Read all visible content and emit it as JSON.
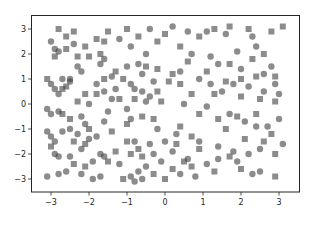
{
  "chart_data": {
    "type": "scatter",
    "title": "",
    "xlabel": "",
    "ylabel": "",
    "xlim": [
      -3.52,
      3.55
    ],
    "ylim": [
      -3.52,
      3.55
    ],
    "xticks": [
      -3,
      -2,
      -1,
      0,
      1,
      2,
      3
    ],
    "yticks": [
      -3,
      -2,
      -1,
      0,
      1,
      2,
      3
    ],
    "xtick_labels": [
      "−3",
      "−2",
      "−1",
      "0",
      "1",
      "2",
      "3"
    ],
    "ytick_labels": [
      "−3",
      "−2",
      "−1",
      "0",
      "1",
      "2",
      "3"
    ],
    "grid": false,
    "legend": null,
    "marker_color": "#404040",
    "marker_alpha": 0.6,
    "series": [
      {
        "name": "circles",
        "marker": "o",
        "points": [
          [
            -3.0,
            2.5
          ],
          [
            -2.9,
            2.2
          ],
          [
            -2.8,
            2.1
          ],
          [
            -2.3,
            1.5
          ],
          [
            -2.2,
            1.3
          ],
          [
            -2.5,
            0.9
          ],
          [
            -1.6,
            1.8
          ],
          [
            -1.7,
            1.6
          ],
          [
            -1.2,
            2.6
          ],
          [
            -0.9,
            2.3
          ],
          [
            -0.4,
            3.0
          ],
          [
            -0.5,
            2.0
          ],
          [
            -1.4,
            1.1
          ],
          [
            -1.0,
            1.5
          ],
          [
            -0.7,
            1.6
          ],
          [
            -0.6,
            1.2
          ],
          [
            -3.0,
            0.8
          ],
          [
            -2.9,
            0.6
          ],
          [
            -2.8,
            0.4
          ],
          [
            -2.7,
            1.0
          ],
          [
            -2.5,
            1.0
          ],
          [
            -1.8,
            0.8
          ],
          [
            -1.6,
            0.5
          ],
          [
            -1.4,
            0.2
          ],
          [
            -0.6,
            0.5
          ],
          [
            -0.4,
            0.3
          ],
          [
            -0.9,
            0.8
          ],
          [
            -0.8,
            0.6
          ],
          [
            -0.3,
            0.9
          ],
          [
            -0.5,
            0.1
          ],
          [
            -2.0,
            0.0
          ],
          [
            -1.5,
            -0.3
          ],
          [
            -3.1,
            -0.2
          ],
          [
            -3.0,
            -0.4
          ],
          [
            -2.8,
            -0.3
          ],
          [
            -2.2,
            -0.5
          ],
          [
            -2.1,
            -0.8
          ],
          [
            -1.6,
            -0.7
          ],
          [
            -1.0,
            -0.2
          ],
          [
            -0.9,
            -0.6
          ],
          [
            -3.1,
            -1.1
          ],
          [
            -3.0,
            -1.3
          ],
          [
            -2.9,
            -1.5
          ],
          [
            -2.7,
            -1.1
          ],
          [
            -2.5,
            -1.0
          ],
          [
            -2.3,
            -1.2
          ],
          [
            -2.0,
            -1.4
          ],
          [
            -1.8,
            -1.3
          ],
          [
            -2.9,
            -2.0
          ],
          [
            -2.8,
            -2.1
          ],
          [
            -2.5,
            -2.1
          ],
          [
            -2.2,
            -1.8
          ],
          [
            -1.9,
            -2.3
          ],
          [
            -1.7,
            -2.0
          ],
          [
            -1.6,
            -2.1
          ],
          [
            -1.2,
            -2.4
          ],
          [
            -3.1,
            -2.9
          ],
          [
            -2.8,
            -2.8
          ],
          [
            -2.6,
            -2.7
          ],
          [
            -2.2,
            -2.8
          ],
          [
            -1.9,
            -3.0
          ],
          [
            -1.7,
            -2.9
          ],
          [
            -0.9,
            -2.9
          ],
          [
            -0.7,
            -2.7
          ],
          [
            -0.8,
            -3.1
          ],
          [
            -0.6,
            -3.0
          ],
          [
            -0.5,
            -2.5
          ],
          [
            -0.3,
            -2.0
          ],
          [
            -0.4,
            -1.6
          ],
          [
            -0.8,
            -1.5
          ],
          [
            -0.2,
            -1.0
          ],
          [
            0.4,
            -2.8
          ],
          [
            0.2,
            3.1
          ],
          [
            0.6,
            2.9
          ],
          [
            1.1,
            2.9
          ],
          [
            1.6,
            2.8
          ],
          [
            2.3,
            2.7
          ],
          [
            2.4,
            2.3
          ],
          [
            1.9,
            2.1
          ],
          [
            0.7,
            2.0
          ],
          [
            1.2,
            1.9
          ],
          [
            1.4,
            1.6
          ],
          [
            2.0,
            1.4
          ],
          [
            2.6,
            1.2
          ],
          [
            2.8,
            1.5
          ],
          [
            0.4,
            1.3
          ],
          [
            0.9,
            1.0
          ],
          [
            1.2,
            0.8
          ],
          [
            1.5,
            0.5
          ],
          [
            1.8,
            0.8
          ],
          [
            2.2,
            0.7
          ],
          [
            2.6,
            0.5
          ],
          [
            2.9,
            0.8
          ],
          [
            3.0,
            0.4
          ],
          [
            0.5,
            0.0
          ],
          [
            1.1,
            -0.1
          ],
          [
            1.7,
            -0.4
          ],
          [
            2.1,
            -0.7
          ],
          [
            2.4,
            -0.9
          ],
          [
            2.7,
            -0.9
          ],
          [
            3.0,
            -0.6
          ],
          [
            0.3,
            -1.2
          ],
          [
            0.9,
            -1.5
          ],
          [
            1.4,
            -1.7
          ],
          [
            1.8,
            -1.9
          ],
          [
            2.2,
            -2.0
          ],
          [
            2.5,
            -1.8
          ],
          [
            3.1,
            -1.6
          ],
          [
            0.6,
            -2.2
          ],
          [
            1.1,
            -2.4
          ],
          [
            1.9,
            -2.3
          ],
          [
            2.3,
            -2.8
          ],
          [
            2.5,
            -2.7
          ],
          [
            0.0,
            -1.5
          ],
          [
            0.2,
            -1.9
          ],
          [
            -0.1,
            -2.3
          ],
          [
            0.8,
            -2.9
          ],
          [
            1.4,
            -2.2
          ],
          [
            -1.3,
            0.6
          ],
          [
            -2.4,
            2.4
          ]
        ]
      },
      {
        "name": "squares",
        "marker": "s",
        "points": [
          [
            -2.8,
            3.0
          ],
          [
            -2.6,
            2.7
          ],
          [
            -2.4,
            2.9
          ],
          [
            -2.6,
            2.2
          ],
          [
            -2.1,
            2.3
          ],
          [
            -1.8,
            2.6
          ],
          [
            -1.5,
            2.9
          ],
          [
            -1.6,
            2.5
          ],
          [
            -1.0,
            3.0
          ],
          [
            -0.7,
            2.7
          ],
          [
            -0.2,
            2.5
          ],
          [
            0.0,
            2.8
          ],
          [
            -2.9,
            1.9
          ],
          [
            -2.3,
            1.9
          ],
          [
            -2.0,
            1.9
          ],
          [
            -1.7,
            2.0
          ],
          [
            -1.3,
            1.3
          ],
          [
            -1.1,
            1.0
          ],
          [
            -0.5,
            1.5
          ],
          [
            -0.2,
            1.4
          ],
          [
            -2.6,
            0.7
          ],
          [
            -2.1,
            0.4
          ],
          [
            -1.8,
            0.4
          ],
          [
            -1.2,
            0.2
          ],
          [
            -3.1,
            1.0
          ],
          [
            -2.7,
            0.6
          ],
          [
            -2.3,
            0.1
          ],
          [
            -0.8,
            0.2
          ],
          [
            -0.2,
            0.5
          ],
          [
            0.1,
            0.9
          ],
          [
            -0.1,
            0.1
          ],
          [
            -1.6,
            1.0
          ],
          [
            -2.7,
            -0.4
          ],
          [
            -2.5,
            -0.6
          ],
          [
            -2.0,
            -1.0
          ],
          [
            -1.4,
            -1.1
          ],
          [
            -1.0,
            -0.8
          ],
          [
            -0.6,
            -0.5
          ],
          [
            -0.3,
            -0.6
          ],
          [
            -2.1,
            -1.6
          ],
          [
            -3.0,
            -1.7
          ],
          [
            -2.4,
            -1.5
          ],
          [
            -1.3,
            -1.9
          ],
          [
            -1.0,
            -1.5
          ],
          [
            -0.7,
            -1.8
          ],
          [
            -0.9,
            -2.0
          ],
          [
            -2.4,
            -2.4
          ],
          [
            -2.1,
            -2.5
          ],
          [
            -1.5,
            -2.3
          ],
          [
            -0.6,
            -2.1
          ],
          [
            -0.3,
            -2.8
          ],
          [
            -1.1,
            -3.0
          ],
          [
            0.2,
            -2.6
          ],
          [
            0.5,
            -2.3
          ],
          [
            0.7,
            -2.5
          ],
          [
            0.0,
            -3.0
          ],
          [
            0.4,
            2.3
          ],
          [
            0.9,
            2.7
          ],
          [
            1.3,
            3.0
          ],
          [
            1.7,
            3.1
          ],
          [
            2.2,
            3.0
          ],
          [
            2.8,
            2.9
          ],
          [
            3.1,
            3.1
          ],
          [
            2.6,
            2.0
          ],
          [
            2.3,
            1.8
          ],
          [
            1.7,
            1.6
          ],
          [
            1.1,
            1.3
          ],
          [
            0.6,
            1.7
          ],
          [
            0.2,
            1.2
          ],
          [
            2.0,
            1.0
          ],
          [
            2.4,
            1.1
          ],
          [
            2.9,
            1.1
          ],
          [
            1.6,
            0.9
          ],
          [
            1.3,
            0.4
          ],
          [
            0.7,
            0.4
          ],
          [
            0.4,
            0.8
          ],
          [
            2.0,
            0.3
          ],
          [
            2.5,
            0.2
          ],
          [
            2.9,
            0.1
          ],
          [
            0.9,
            -0.4
          ],
          [
            1.4,
            -0.6
          ],
          [
            1.9,
            -0.5
          ],
          [
            2.4,
            -0.4
          ],
          [
            2.8,
            -1.2
          ],
          [
            0.4,
            -0.9
          ],
          [
            0.7,
            -1.3
          ],
          [
            1.6,
            -1.0
          ],
          [
            2.1,
            -1.4
          ],
          [
            2.6,
            -1.5
          ],
          [
            2.9,
            -2.0
          ],
          [
            1.7,
            -2.1
          ],
          [
            1.3,
            -2.7
          ],
          [
            2.0,
            -2.6
          ],
          [
            2.9,
            -2.9
          ],
          [
            0.9,
            -1.8
          ],
          [
            0.3,
            -1.6
          ]
        ]
      }
    ]
  }
}
